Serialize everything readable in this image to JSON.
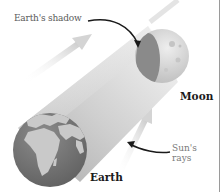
{
  "diagram": {
    "type": "lunar-eclipse-illustration",
    "labels": {
      "earths_shadow": "Earth's shadow",
      "moon": "Moon",
      "suns_rays": "Sun's rays",
      "earth": "Earth"
    },
    "colors": {
      "background": "#ffffff",
      "shadow_cylinder_light": "#f4f4f4",
      "shadow_cylinder_dark": "#bdbdbd",
      "earth_ocean": "#7a7a7a",
      "earth_land": "#c9c9c9",
      "moon_surface": "#d6d6d6",
      "moon_shadowed": "#8a8a8a",
      "ray_arrow": "#d9d9d9",
      "pointer_arrow": "#1a1a1a",
      "border": "#9a9a9a"
    }
  }
}
